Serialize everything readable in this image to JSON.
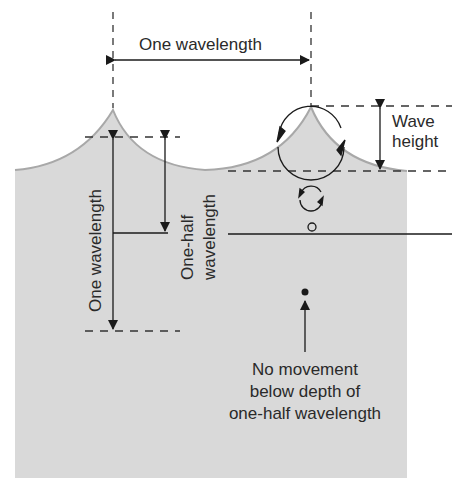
{
  "diagram": {
    "labels": {
      "one_wavelength_top": "One wavelength",
      "wave_height_1": "Wave",
      "wave_height_2": "height",
      "one_wavelength_vertical": "One wavelength",
      "one_half_1": "One-half",
      "one_half_2": "wavelength",
      "no_movement_1": "No movement",
      "no_movement_2": "below depth of",
      "no_movement_3": "one-half wavelength"
    },
    "colors": {
      "water": "#d9d9d9",
      "surface_line": "#a8a8a8",
      "ink": "#1a1a1a"
    }
  }
}
